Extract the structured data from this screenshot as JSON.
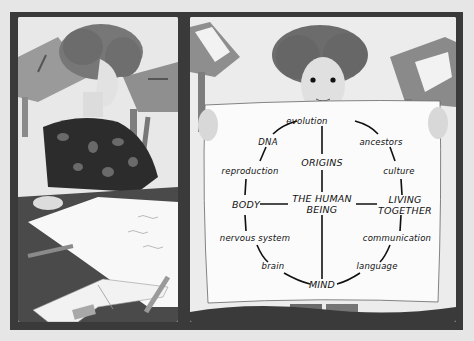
{
  "illustration": {
    "left_panel": {
      "description": "Woman with curly hair in patterned sweater writing on a large sheet of paper at a desk, open book and pencils in foreground"
    },
    "right_panel": {
      "description": "Woman with curly hair holding up a poster showing a concept map"
    }
  },
  "concept_map": {
    "center": "THE HUMAN BEING",
    "major_nodes": [
      {
        "id": "origins",
        "label": "ORIGINS"
      },
      {
        "id": "body",
        "label": "BODY"
      },
      {
        "id": "living_together",
        "label": "LIVING TOGETHER"
      },
      {
        "id": "mind",
        "label": "MIND"
      }
    ],
    "ring_nodes": [
      {
        "id": "evolution",
        "label": "evolution"
      },
      {
        "id": "dna",
        "label": "DNA"
      },
      {
        "id": "ancestors",
        "label": "ancestors"
      },
      {
        "id": "reproduction",
        "label": "reproduction"
      },
      {
        "id": "culture",
        "label": "culture"
      },
      {
        "id": "nervous_system",
        "label": "nervous system"
      },
      {
        "id": "communication",
        "label": "communication"
      },
      {
        "id": "brain",
        "label": "brain"
      },
      {
        "id": "language",
        "label": "language"
      }
    ],
    "labels": {
      "evolution": "evolution",
      "dna": "DNA",
      "ancestors": "ancestors",
      "reproduction": "reproduction",
      "culture": "culture",
      "origins": "ORIGINS",
      "human_1": "THE HUMAN",
      "human_2": "BEING",
      "body": "BODY",
      "living_1": "LIVING",
      "living_2": "TOGETHER",
      "nervous_system": "nervous system",
      "communication": "communication",
      "brain": "brain",
      "language": "language",
      "mind": "MIND"
    }
  }
}
